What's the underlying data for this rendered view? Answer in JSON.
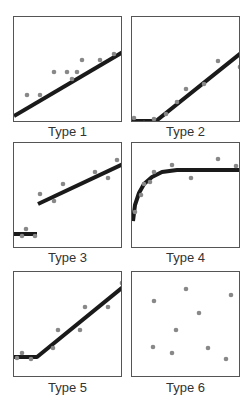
{
  "colors": {
    "line": "#1a1a1a",
    "point": "#888888",
    "border": "#555555",
    "label": "#333333"
  },
  "chart_data": [
    {
      "type": "scatter",
      "title": "Type 1",
      "description": "Single linear trend",
      "xlim": [
        0,
        109
      ],
      "ylim": [
        106,
        0
      ],
      "points": [
        [
          13,
          78
        ],
        [
          26,
          78
        ],
        [
          40,
          55
        ],
        [
          53,
          55
        ],
        [
          58,
          62
        ],
        [
          63,
          55
        ],
        [
          68,
          43
        ],
        [
          86,
          43
        ],
        [
          100,
          37
        ]
      ],
      "fit": [
        [
          0,
          99
        ],
        [
          109,
          35
        ]
      ]
    },
    {
      "type": "scatter",
      "title": "Type 2",
      "description": "Flat then linear increase (threshold at bottom)",
      "xlim": [
        0,
        109
      ],
      "ylim": [
        106,
        0
      ],
      "points": [
        [
          2,
          101
        ],
        [
          12,
          106
        ],
        [
          22,
          102
        ],
        [
          34,
          97
        ],
        [
          45,
          85
        ],
        [
          54,
          72
        ],
        [
          72,
          67
        ],
        [
          86,
          44
        ],
        [
          108,
          50
        ]
      ],
      "fit": [
        [
          0,
          104
        ],
        [
          24,
          104
        ],
        [
          109,
          36
        ]
      ]
    },
    {
      "type": "scatter",
      "title": "Type 3",
      "description": "Step discontinuity then linear increase",
      "xlim": [
        0,
        109
      ],
      "ylim": [
        106,
        0
      ],
      "points": [
        [
          8,
          93
        ],
        [
          12,
          86
        ],
        [
          21,
          93
        ],
        [
          26,
          51
        ],
        [
          40,
          58
        ],
        [
          49,
          41
        ],
        [
          81,
          29
        ],
        [
          94,
          35
        ],
        [
          103,
          17
        ]
      ],
      "fit_segments": [
        [
          [
            0,
            91
          ],
          [
            23,
            91
          ]
        ],
        [
          [
            24,
            61
          ],
          [
            109,
            21
          ]
        ]
      ]
    },
    {
      "type": "scatter",
      "title": "Type 4",
      "description": "Rapid rise then plateau (saturation)",
      "xlim": [
        0,
        109
      ],
      "ylim": [
        106,
        0
      ],
      "points": [
        [
          3,
          69
        ],
        [
          9,
          52
        ],
        [
          12,
          41
        ],
        [
          18,
          39
        ],
        [
          22,
          29
        ],
        [
          40,
          22
        ],
        [
          59,
          35
        ],
        [
          86,
          16
        ],
        [
          104,
          23
        ]
      ],
      "fit": [
        [
          1,
          78
        ],
        [
          3,
          62
        ],
        [
          7,
          50
        ],
        [
          12,
          41
        ],
        [
          20,
          34
        ],
        [
          30,
          29
        ],
        [
          45,
          27
        ],
        [
          109,
          27
        ]
      ]
    },
    {
      "type": "scatter",
      "title": "Type 5",
      "description": "Flat baseline then linear increase",
      "xlim": [
        0,
        109
      ],
      "ylim": [
        106,
        0
      ],
      "points": [
        [
          3,
          86
        ],
        [
          8,
          81
        ],
        [
          17,
          87
        ],
        [
          39,
          76
        ],
        [
          44,
          58
        ],
        [
          66,
          58
        ],
        [
          71,
          35
        ],
        [
          94,
          35
        ],
        [
          108,
          11
        ]
      ],
      "fit": [
        [
          0,
          85
        ],
        [
          23,
          85
        ],
        [
          109,
          15
        ]
      ]
    },
    {
      "type": "scatter",
      "title": "Type 6",
      "description": "No relationship (random scatter)",
      "xlim": [
        0,
        109
      ],
      "ylim": [
        106,
        0
      ],
      "points": [
        [
          54,
          17
        ],
        [
          99,
          23
        ],
        [
          22,
          29
        ],
        [
          67,
          41
        ],
        [
          44,
          58
        ],
        [
          21,
          75
        ],
        [
          76,
          76
        ],
        [
          40,
          81
        ],
        [
          94,
          87
        ]
      ],
      "fit": []
    }
  ],
  "labels": [
    "Type 1",
    "Type 2",
    "Type 3",
    "Type 4",
    "Type 5",
    "Type 6"
  ]
}
